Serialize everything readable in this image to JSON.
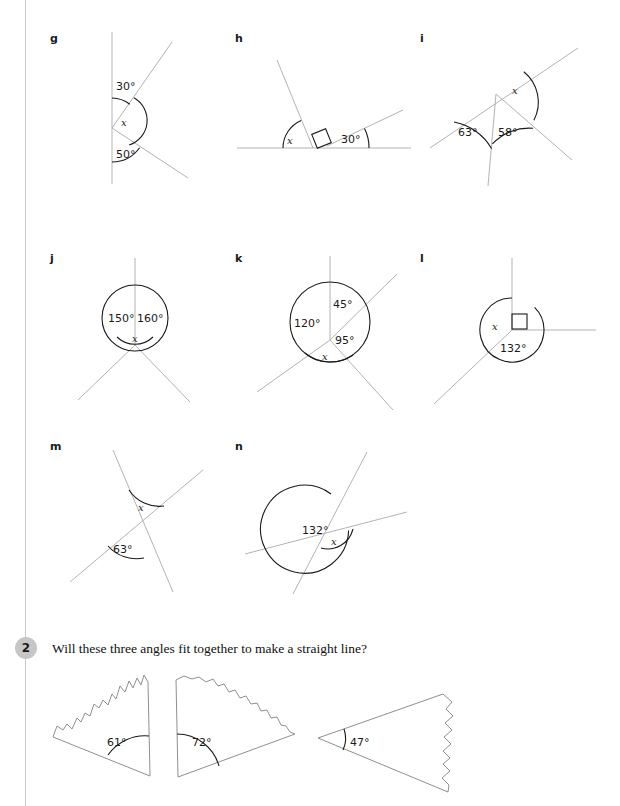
{
  "page": {
    "width": 620,
    "height": 806,
    "background": "#ffffff",
    "rule_color": "#c9c9c9",
    "line_color": "#b3b3b3",
    "arc_color": "#1a1a1a",
    "tear_color": "#8f8f8f"
  },
  "question2": {
    "number": "2",
    "text": "Will these three angles fit together to make a straight line?"
  },
  "figures": [
    {
      "key": "g",
      "label": "g",
      "description": "vertical line with two rays to the right from one vertex",
      "angles": [
        "30°",
        "x",
        "50°"
      ],
      "unknown": "x"
    },
    {
      "key": "h",
      "label": "h",
      "description": "horizontal base line with two rays, right angle marked between them",
      "angles": [
        "x",
        "30°"
      ],
      "right_angle": true,
      "unknown": "x"
    },
    {
      "key": "i",
      "label": "i",
      "description": "straight line crossed by two rays below",
      "angles": [
        "x",
        "63°",
        "58°"
      ],
      "unknown": "x"
    },
    {
      "key": "j",
      "label": "j",
      "description": "three rays from a point, angles around a point",
      "angles": [
        "150°",
        "160°",
        "x"
      ],
      "unknown": "x"
    },
    {
      "key": "k",
      "label": "k",
      "description": "four rays from a point, angles around a point",
      "angles": [
        "45°",
        "120°",
        "95°",
        "x"
      ],
      "unknown": "x"
    },
    {
      "key": "l",
      "label": "l",
      "description": "vertical ray, horizontal ray with right angle, and one ray down-left",
      "angles": [
        "x",
        "132°"
      ],
      "right_angle": true,
      "unknown": "x"
    },
    {
      "key": "m",
      "label": "m",
      "description": "two crossing straight lines, vertically opposite angles",
      "angles": [
        "x",
        "63°"
      ],
      "unknown": "x"
    },
    {
      "key": "n",
      "label": "n",
      "description": "two crossing straight lines, vertically opposite angles",
      "angles": [
        "132°",
        "x"
      ],
      "unknown": "x"
    }
  ],
  "torn_shapes": [
    {
      "key": "shape1",
      "angle": "61°",
      "angle_position": "bottom-right"
    },
    {
      "key": "shape2",
      "angle": "72°",
      "angle_position": "bottom-left"
    },
    {
      "key": "shape3",
      "angle": "47°",
      "angle_position": "left"
    }
  ]
}
